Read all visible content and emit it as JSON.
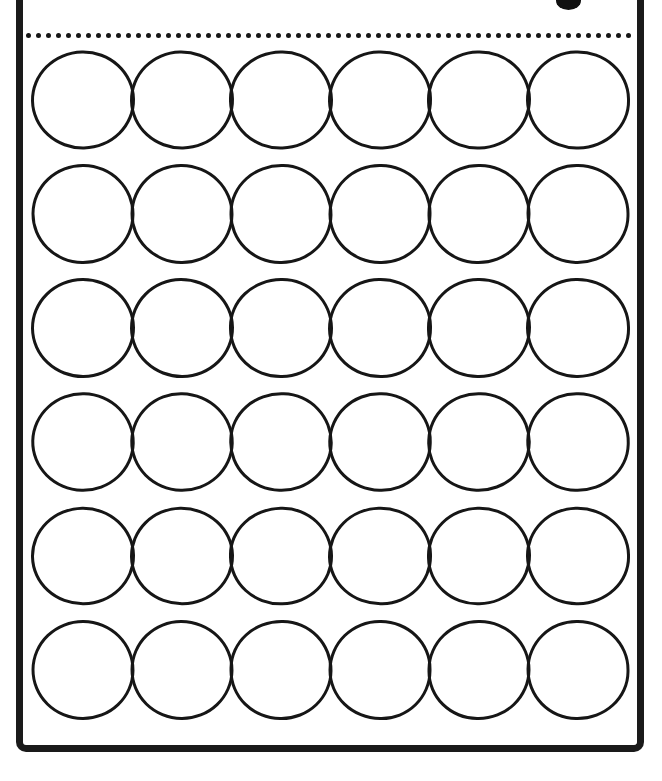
{
  "page": {
    "width": 662,
    "height": 781,
    "background_color": "#ffffff",
    "ink_color": "#161616"
  },
  "frame": {
    "border_color": "#1a1a1a",
    "border_width_px": 7,
    "corner_radius_px": 10,
    "left_px": 16,
    "right_px": 644,
    "bottom_px": 752,
    "top_cropped": true
  },
  "ink_blob": {
    "name": "ink-blob",
    "color": "#101010",
    "left_px": 556,
    "top_px": -9,
    "width_px": 25,
    "height_px": 19,
    "cropped_at_top": true
  },
  "dotted_rule": {
    "name": "dotted-separator",
    "dot_color": "#151515",
    "dot_diameter_px": 5,
    "dot_spacing_px": 10,
    "dot_count": 61,
    "left_px": 26,
    "top_px": 33,
    "width_px": 608
  },
  "circle_grid": {
    "rows": 6,
    "columns": 6,
    "total_circles": 36,
    "circle_width_px": 104,
    "circle_height_px": 100,
    "column_pitch_px": 99,
    "row_pitch_px": 114,
    "stroke_width_px": 3.4,
    "stroke_color": "#161616",
    "fill": "none",
    "left_px": 31,
    "top_px": 50,
    "cells": [
      [
        "r1c1",
        "r1c2",
        "r1c3",
        "r1c4",
        "r1c5",
        "r1c6"
      ],
      [
        "r2c1",
        "r2c2",
        "r2c3",
        "r2c4",
        "r2c5",
        "r2c6"
      ],
      [
        "r3c1",
        "r3c2",
        "r3c3",
        "r3c4",
        "r3c5",
        "r3c6"
      ],
      [
        "r4c1",
        "r4c2",
        "r4c3",
        "r4c4",
        "r4c5",
        "r4c6"
      ],
      [
        "r5c1",
        "r5c2",
        "r5c3",
        "r5c4",
        "r5c5",
        "r5c6"
      ],
      [
        "r6c1",
        "r6c2",
        "r6c3",
        "r6c4",
        "r6c5",
        "r6c6"
      ]
    ]
  }
}
